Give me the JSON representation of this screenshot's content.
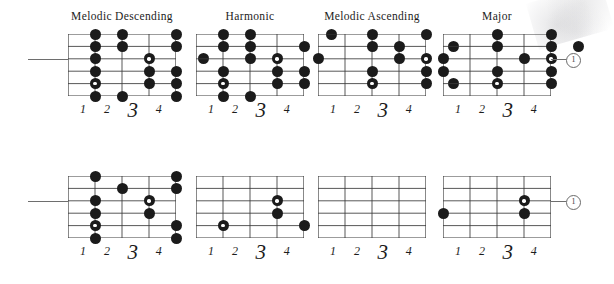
{
  "page": {
    "kind": "guitar-scale-fretboard-diagrams",
    "ink_color": "#1b1b1b",
    "paper_color": "#ffffff",
    "grid_line_color": "#3a3a3a",
    "leader_color": "#6e6e6e"
  },
  "fret_numbers": [
    "1",
    "2",
    "3",
    "4"
  ],
  "string_marker": {
    "label": "1"
  },
  "diagrams": [
    {
      "id": "melodic-descending-upper",
      "title": "Melodic Descending",
      "row": "upper",
      "strings": 6,
      "frets": 4,
      "has_leader_line": true,
      "leader_side": "left",
      "leader_string": 3,
      "dots": [
        {
          "string": 1,
          "fret": 1,
          "root": false
        },
        {
          "string": 1,
          "fret": 2,
          "root": false
        },
        {
          "string": 1,
          "fret": 4,
          "root": false
        },
        {
          "string": 2,
          "fret": 1,
          "root": false
        },
        {
          "string": 2,
          "fret": 2,
          "root": false
        },
        {
          "string": 2,
          "fret": 4,
          "root": false
        },
        {
          "string": 3,
          "fret": 1,
          "root": false
        },
        {
          "string": 3,
          "fret": 3,
          "root": true
        },
        {
          "string": 3,
          "fret": 5,
          "root": false
        },
        {
          "string": 4,
          "fret": 1,
          "root": false
        },
        {
          "string": 4,
          "fret": 3,
          "root": false
        },
        {
          "string": 4,
          "fret": 4,
          "root": false
        },
        {
          "string": 5,
          "fret": 1,
          "root": true
        },
        {
          "string": 5,
          "fret": 3,
          "root": false
        },
        {
          "string": 5,
          "fret": 4,
          "root": false
        },
        {
          "string": 6,
          "fret": 1,
          "root": false
        },
        {
          "string": 6,
          "fret": 2,
          "root": false
        },
        {
          "string": 6,
          "fret": 4,
          "root": false
        }
      ]
    },
    {
      "id": "harmonic-upper",
      "title": "Harmonic",
      "row": "upper",
      "strings": 6,
      "frets": 4,
      "has_leader_line": false,
      "dots": [
        {
          "string": 1,
          "fret": 1,
          "root": false
        },
        {
          "string": 1,
          "fret": 2,
          "root": false
        },
        {
          "string": 1,
          "fret": 5,
          "root": false
        },
        {
          "string": 2,
          "fret": 1,
          "root": false
        },
        {
          "string": 2,
          "fret": 2,
          "root": false
        },
        {
          "string": 2,
          "fret": 4,
          "root": false
        },
        {
          "string": 3,
          "fret": 2,
          "root": false
        },
        {
          "string": 3,
          "fret": 3,
          "root": true
        },
        {
          "string": 4,
          "fret": 1,
          "root": false
        },
        {
          "string": 4,
          "fret": 3,
          "root": false
        },
        {
          "string": 4,
          "fret": 4,
          "root": false
        },
        {
          "string": 5,
          "fret": 1,
          "root": true
        },
        {
          "string": 5,
          "fret": 3,
          "root": false
        },
        {
          "string": 5,
          "fret": 4,
          "root": false
        },
        {
          "string": 6,
          "fret": 1,
          "root": false
        },
        {
          "string": 6,
          "fret": 2,
          "root": false
        }
      ]
    },
    {
      "id": "melodic-ascending-upper",
      "title": "Melodic Ascending",
      "row": "upper",
      "strings": 6,
      "frets": 4,
      "has_leader_line": false,
      "dots": [
        {
          "string": 1,
          "fret": 2,
          "root": false
        },
        {
          "string": 1,
          "fret": 4,
          "root": false
        },
        {
          "string": 2,
          "fret": 2,
          "root": false
        },
        {
          "string": 2,
          "fret": 3,
          "root": false
        },
        {
          "string": 2,
          "fret": 5,
          "root": false
        },
        {
          "string": 3,
          "fret": 0,
          "root": false
        },
        {
          "string": 3,
          "fret": 3,
          "root": false
        },
        {
          "string": 3,
          "fret": 4,
          "root": true
        },
        {
          "string": 4,
          "fret": 2,
          "root": false
        },
        {
          "string": 4,
          "fret": 4,
          "root": false
        },
        {
          "string": 5,
          "fret": 2,
          "root": true
        },
        {
          "string": 5,
          "fret": 4,
          "root": false
        },
        {
          "string": 5,
          "fret": 5,
          "root": false
        }
      ]
    },
    {
      "id": "major-upper",
      "title": "Major",
      "row": "upper",
      "strings": 6,
      "frets": 4,
      "has_leader_line": true,
      "leader_side": "right",
      "leader_string": 3,
      "dots": [
        {
          "string": 1,
          "fret": 2,
          "root": false
        },
        {
          "string": 1,
          "fret": 4,
          "root": false
        },
        {
          "string": 2,
          "fret": 2,
          "root": false
        },
        {
          "string": 2,
          "fret": 4,
          "root": false
        },
        {
          "string": 2,
          "fret": 5,
          "root": false
        },
        {
          "string": 3,
          "fret": 0,
          "root": false
        },
        {
          "string": 3,
          "fret": 3,
          "root": false
        },
        {
          "string": 3,
          "fret": 4,
          "root": true
        },
        {
          "string": 4,
          "fret": 0,
          "root": false
        },
        {
          "string": 4,
          "fret": 2,
          "root": false
        },
        {
          "string": 4,
          "fret": 4,
          "root": false
        },
        {
          "string": 5,
          "fret": 2,
          "root": true
        },
        {
          "string": 5,
          "fret": 4,
          "root": false
        }
      ]
    },
    {
      "id": "melodic-descending-lower",
      "title": "",
      "row": "lower",
      "strings": 6,
      "frets": 4,
      "has_leader_line": true,
      "leader_side": "left",
      "leader_string": 3,
      "dots": [
        {
          "string": 1,
          "fret": 1,
          "root": false
        },
        {
          "string": 1,
          "fret": 4,
          "root": false
        },
        {
          "string": 2,
          "fret": 2,
          "root": false
        },
        {
          "string": 2,
          "fret": 4,
          "root": false
        },
        {
          "string": 3,
          "fret": 1,
          "root": false
        },
        {
          "string": 3,
          "fret": 3,
          "root": true
        },
        {
          "string": 4,
          "fret": 1,
          "root": false
        },
        {
          "string": 4,
          "fret": 3,
          "root": false
        },
        {
          "string": 5,
          "fret": 1,
          "root": true
        },
        {
          "string": 5,
          "fret": 4,
          "root": false
        },
        {
          "string": 6,
          "fret": 1,
          "root": false
        },
        {
          "string": 6,
          "fret": 4,
          "root": false
        }
      ]
    },
    {
      "id": "harmonic-lower",
      "title": "",
      "row": "lower",
      "strings": 6,
      "frets": 4,
      "has_leader_line": false,
      "dots": [
        {
          "string": 3,
          "fret": 3,
          "root": true
        },
        {
          "string": 4,
          "fret": 3,
          "root": false
        },
        {
          "string": 5,
          "fret": 1,
          "root": true
        },
        {
          "string": 5,
          "fret": 4,
          "root": false
        }
      ]
    },
    {
      "id": "melodic-ascending-lower",
      "title": "",
      "row": "lower",
      "strings": 6,
      "frets": 4,
      "has_leader_line": false,
      "dots": []
    },
    {
      "id": "major-lower",
      "title": "",
      "row": "lower",
      "strings": 6,
      "frets": 4,
      "has_leader_line": true,
      "leader_side": "right",
      "leader_string": 3,
      "dots": [
        {
          "string": 3,
          "fret": 3,
          "root": true
        },
        {
          "string": 4,
          "fret": 0,
          "root": false
        },
        {
          "string": 4,
          "fret": 3,
          "root": false
        }
      ]
    }
  ]
}
